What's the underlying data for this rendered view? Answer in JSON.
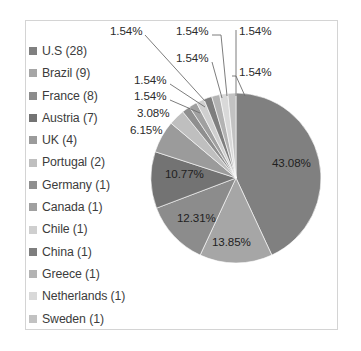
{
  "chart_data": {
    "type": "pie",
    "title": "",
    "total": 65,
    "legend_position": "left",
    "grid": false,
    "categories": [
      "U.S (28)",
      "Brazil (9)",
      "France (8)",
      "Austria (7)",
      "UK (4)",
      "Portugal (2)",
      "Germany (1)",
      "Canada (1)",
      "Chile (1)",
      "China (1)",
      "Greece (1)",
      "Netherlands (1)",
      "Sweden (1)"
    ],
    "values": [
      28,
      9,
      8,
      7,
      4,
      2,
      1,
      1,
      1,
      1,
      1,
      1,
      1
    ],
    "percent_labels": [
      "43.08%",
      "13.85%",
      "12.31%",
      "10.77%",
      "6.15%",
      "3.08%",
      "1.54%",
      "1.54%",
      "1.54%",
      "1.54%",
      "1.54%",
      "1.54%",
      "1.54%"
    ],
    "percents": [
      43.08,
      13.85,
      12.31,
      10.77,
      6.15,
      3.08,
      1.54,
      1.54,
      1.54,
      1.54,
      1.54,
      1.54,
      1.54
    ],
    "slice_colors": [
      "#808080",
      "#a6a6a6",
      "#8c8c8c",
      "#737373",
      "#9b9b9b",
      "#bfbfbf",
      "#8f8f8f",
      "#a0a0a0",
      "#cfcfcf",
      "#7e7e7e",
      "#b3b3b3",
      "#d9d9d9",
      "#c2c2c2"
    ],
    "labels": [
      {
        "text": "43.08%",
        "x": 272,
        "y": 157,
        "placement": "inside"
      },
      {
        "text": "13.85%",
        "x": 212,
        "y": 236,
        "placement": "inside"
      },
      {
        "text": "12.31%",
        "x": 177,
        "y": 212,
        "placement": "inside"
      },
      {
        "text": "10.77%",
        "x": 165,
        "y": 168,
        "placement": "inside"
      },
      {
        "text": "6.15%",
        "x": 130,
        "y": 124,
        "placement": "outside"
      },
      {
        "text": "3.08%",
        "x": 137,
        "y": 107,
        "placement": "outside"
      },
      {
        "text": "1.54%",
        "x": 134,
        "y": 90,
        "placement": "outside"
      },
      {
        "text": "1.54%",
        "x": 134,
        "y": 74,
        "placement": "outside"
      },
      {
        "text": "1.54%",
        "x": 110,
        "y": 25,
        "placement": "outside"
      },
      {
        "text": "1.54%",
        "x": 176,
        "y": 52,
        "placement": "outside"
      },
      {
        "text": "1.54%",
        "x": 176,
        "y": 25,
        "placement": "outside"
      },
      {
        "text": "1.54%",
        "x": 239,
        "y": 66,
        "placement": "outside"
      },
      {
        "text": "1.54%",
        "x": 239,
        "y": 25,
        "placement": "outside"
      }
    ],
    "leader_lines": [
      {
        "x1": 145,
        "y1": 35,
        "x2": 205,
        "y2": 101
      },
      {
        "x1": 212,
        "y1": 62,
        "x2": 222,
        "y2": 98
      },
      {
        "x1": 212,
        "y1": 35,
        "x2": 221,
        "y2": 35
      },
      {
        "x1": 221,
        "y1": 35,
        "x2": 227,
        "y2": 96
      },
      {
        "x1": 236,
        "y1": 35,
        "x2": 236,
        "y2": 96
      },
      {
        "x1": 236,
        "y1": 30,
        "x2": 236,
        "y2": 35
      },
      {
        "x1": 236,
        "y1": 76,
        "x2": 245,
        "y2": 96
      },
      {
        "x1": 232,
        "y1": 76,
        "x2": 236,
        "y2": 76
      },
      {
        "x1": 170,
        "y1": 100,
        "x2": 200,
        "y2": 113
      },
      {
        "x1": 170,
        "y1": 84,
        "x2": 205,
        "y2": 107
      }
    ]
  },
  "legend": {
    "items": [
      {
        "label": "U.S (28)",
        "color": "#808080"
      },
      {
        "label": "Brazil (9)",
        "color": "#a6a6a6"
      },
      {
        "label": "France (8)",
        "color": "#8c8c8c"
      },
      {
        "label": "Austria (7)",
        "color": "#737373"
      },
      {
        "label": "UK (4)",
        "color": "#9b9b9b"
      },
      {
        "label": "Portugal (2)",
        "color": "#bfbfbf"
      },
      {
        "label": "Germany (1)",
        "color": "#8f8f8f"
      },
      {
        "label": "Canada (1)",
        "color": "#a0a0a0"
      },
      {
        "label": "Chile (1)",
        "color": "#cfcfcf"
      },
      {
        "label": "China (1)",
        "color": "#7e7e7e"
      },
      {
        "label": "Greece (1)",
        "color": "#b3b3b3"
      },
      {
        "label": "Netherlands (1)",
        "color": "#d9d9d9"
      },
      {
        "label": "Sweden (1)",
        "color": "#c2c2c2"
      }
    ]
  },
  "style": {
    "background": "#ffffff",
    "frame_border": "#d4d4d4",
    "label_color": "#2b2b2b",
    "legend_text_color": "#3c3c3c",
    "leader_line_color": "#6e6e6e"
  }
}
